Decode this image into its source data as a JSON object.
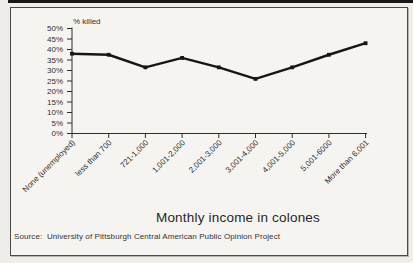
{
  "chart_data": {
    "type": "line",
    "y_axis_label": "% killed",
    "x_axis_title": "Monthly income in colones",
    "categories": [
      "None (unemployed)",
      "less than 700",
      "721-1,000",
      "1,001-2,000",
      "2,001-3,000",
      "3,001-4,000",
      "4,001-5,000",
      "5,001-6000",
      "More than 6,001"
    ],
    "values": [
      38,
      37.5,
      31.5,
      36,
      31.5,
      26,
      31.5,
      37.5,
      43
    ],
    "ylim": [
      0,
      50
    ],
    "y_ticks": [
      0,
      5,
      10,
      15,
      20,
      25,
      30,
      35,
      40,
      45,
      50
    ],
    "y_tick_suffix": "%",
    "grid": false,
    "legend_position": "none",
    "marker": "square",
    "line_color": "#161616"
  },
  "footer": {
    "source": "Source:  University of Pittsburgh Central American Public Opinion Project"
  },
  "colors": {
    "axis": "#2e2e2c",
    "tick_text": "#2f2f2d",
    "line": "#161616",
    "frame_border": "#4a4a48",
    "page_background": "#efede9",
    "chart_background": "#f6f4f0",
    "top_rule": "#171717"
  }
}
